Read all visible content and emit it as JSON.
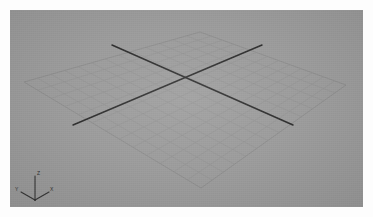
{
  "app": {
    "window_title": "3D Viewport",
    "viewport_name": "Perspective"
  },
  "colors": {
    "page_background": "#fdfdfd",
    "viewport_background": "#9b9b9b",
    "grid_line": "#8a8a8a",
    "grid_line_major": "#7e7e7e",
    "axis_line": "#2b2b2b",
    "gizmo_line": "#333333",
    "gizmo_label": "#2c2c2c"
  },
  "viewport": {
    "x": 10,
    "y": 10,
    "width": 353,
    "height": 197
  },
  "grid": {
    "label": "ground-plane-grid",
    "divisions_u": 13,
    "divisions_v": 13,
    "corner_top": {
      "x": 190,
      "y": 22
    },
    "corner_right": {
      "x": 336,
      "y": 75
    },
    "corner_bottom": {
      "x": 191,
      "y": 178
    },
    "corner_left": {
      "x": 14,
      "y": 72
    }
  },
  "axes": {
    "label": "construction-axis-lines",
    "line_a": {
      "name": "axis-line-x",
      "x1": 102,
      "y1": 35,
      "x2": 283,
      "y2": 115
    },
    "line_b": {
      "name": "axis-line-y",
      "x1": 252,
      "y1": 35,
      "x2": 63,
      "y2": 115
    }
  },
  "gizmo": {
    "label": "axis-orientation-gizmo",
    "origin": {
      "x": 25,
      "y": 190
    },
    "axis_z": {
      "label": "Z",
      "tip": {
        "x": 25,
        "y": 166
      },
      "label_pos": {
        "x": 27,
        "y": 165
      }
    },
    "axis_y": {
      "label": "Y",
      "tip": {
        "x": 11,
        "y": 182
      },
      "label_pos": {
        "x": 5,
        "y": 181
      }
    },
    "axis_x": {
      "label": "X",
      "tip": {
        "x": 39,
        "y": 182
      },
      "label_pos": {
        "x": 40,
        "y": 181
      }
    }
  }
}
